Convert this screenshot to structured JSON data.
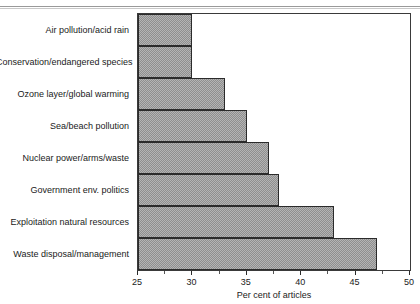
{
  "chart_data": {
    "type": "bar",
    "orientation": "horizontal",
    "title": "",
    "subtitle": "",
    "xlabel": "Per cent of articles",
    "ylabel": "",
    "xlim": [
      25,
      50
    ],
    "ylim": null,
    "grid": false,
    "legend": null,
    "legend_position": "none",
    "x_ticks": [
      25,
      30,
      35,
      40,
      45,
      50
    ],
    "x_tick_labels": [
      "25",
      "30",
      "35",
      "40",
      "45",
      "50"
    ],
    "x_minor_ticks": [
      27.5,
      32.5,
      37.5,
      42.5,
      47.5
    ],
    "categories": [
      "Air pollution/acid rain",
      "Conservation/endangered species",
      "Ozone layer/global warming",
      "Sea/beach pollution",
      "Nuclear power/arms/waste",
      "Government env. politics",
      "Exploitation natural resources",
      "Waste disposal/management"
    ],
    "values": [
      30,
      30,
      33,
      35,
      37,
      38,
      43,
      47
    ],
    "bar_fill_color": "#b4b4b4",
    "bar_edge_color": "#2b2b2b",
    "frame_color": "#3a3a3a",
    "background_color": "#ffffff"
  }
}
